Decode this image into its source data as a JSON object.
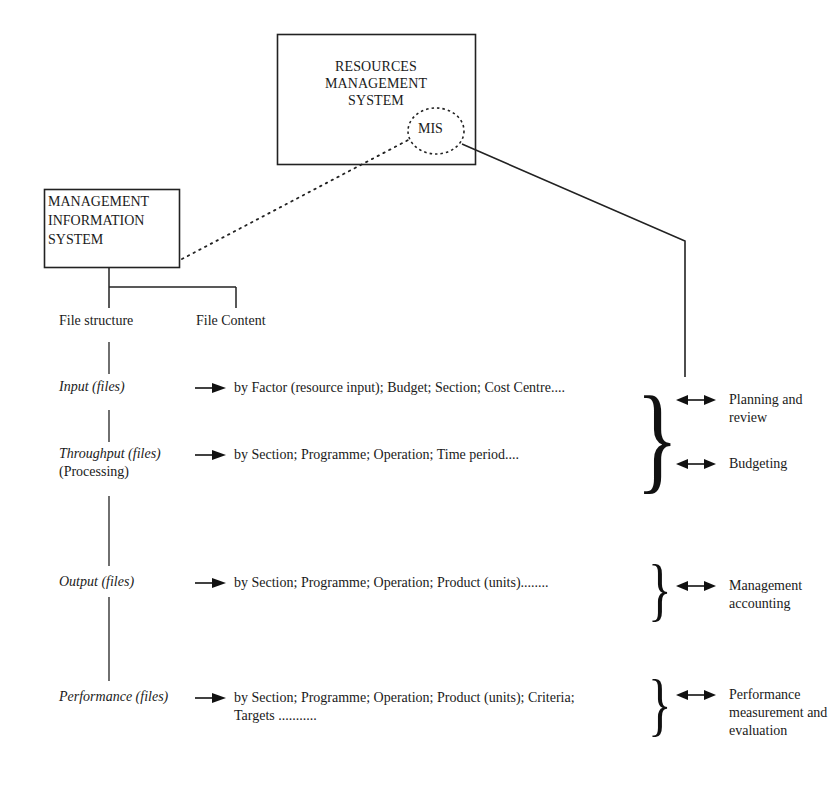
{
  "diagram": {
    "rms_box": {
      "title_lines": [
        "RESOURCES",
        "MANAGEMENT",
        "SYSTEM"
      ],
      "inner_circle_label": "MIS"
    },
    "mis_box": {
      "title_lines": [
        "MANAGEMENT",
        "INFORMATION",
        "SYSTEM"
      ]
    },
    "branches": {
      "file_structure": "File structure",
      "file_content": "File Content"
    },
    "rows": [
      {
        "label": "Input (files)",
        "sub_label": "",
        "content_lines": [
          "by Factor (resource input);  Budget; Section; Cost Centre...."
        ]
      },
      {
        "label": "Throughput (files)",
        "sub_label": "(Processing)",
        "content_lines": [
          "by Section;  Programme; Operation; Time period...."
        ]
      },
      {
        "label": "Output (files)",
        "sub_label": "",
        "content_lines": [
          "by Section;  Programme; Operation; Product (units)........"
        ]
      },
      {
        "label": "Performance (files)",
        "sub_label": "",
        "content_lines": [
          "by Section;  Programme; Operation; Product (units); Criteria;",
          "Targets ..........."
        ]
      }
    ],
    "uses": [
      {
        "lines": [
          "Planning and",
          "review"
        ]
      },
      {
        "lines": [
          "Budgeting"
        ]
      },
      {
        "lines": [
          "Management",
          "accounting"
        ]
      },
      {
        "lines": [
          "Performance",
          "measurement and",
          "evaluation"
        ]
      }
    ],
    "symbols": {
      "right_arrow": "→",
      "double_arrow": "↔",
      "brace": "}"
    },
    "colors": {
      "ink": "#1a1a1a",
      "background": "#ffffff"
    }
  }
}
